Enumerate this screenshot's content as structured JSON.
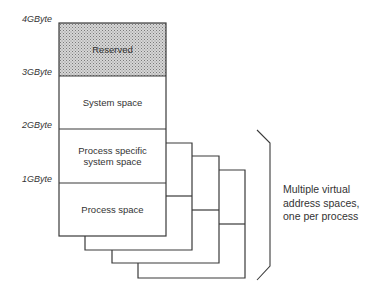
{
  "diagram": {
    "type": "memory-address-space-layout",
    "axis_labels": [
      "4GByte",
      "3GByte",
      "2GByte",
      "1GByte"
    ],
    "segments": [
      {
        "label": "Reserved",
        "range": "3GByte-4GByte",
        "fill": "stippled-gray"
      },
      {
        "label": "System space",
        "range": "2GByte-3GByte",
        "fill": "white"
      },
      {
        "label": "Process specific system space",
        "label_lines": [
          "Process specific",
          "system space"
        ],
        "range": "1GByte-2GByte",
        "fill": "white"
      },
      {
        "label": "Process space",
        "range": "0-1GByte",
        "fill": "white"
      }
    ],
    "stacked_copies": 4,
    "annotation": {
      "lines": [
        "Multiple virtual",
        "address spaces,",
        "one per process"
      ]
    }
  },
  "colors": {
    "line": "#3a3a3a",
    "reserved_fill": "#b8b8b8",
    "background": "#ffffff"
  }
}
